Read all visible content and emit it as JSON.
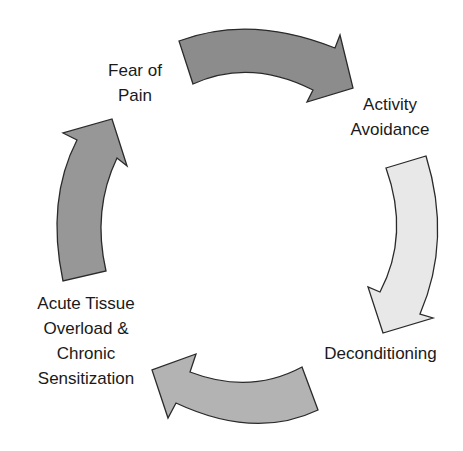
{
  "diagram": {
    "type": "cycle",
    "nodes": [
      {
        "id": "fear",
        "lines": [
          "Fear of",
          "Pain"
        ]
      },
      {
        "id": "activity",
        "lines": [
          "Activity",
          "Avoidance"
        ]
      },
      {
        "id": "decond",
        "lines": [
          "Deconditioning"
        ]
      },
      {
        "id": "acute",
        "lines": [
          "Acute Tissue",
          "Overload &",
          "Chronic",
          "Sensitization"
        ]
      }
    ],
    "arrows": [
      {
        "from": "fear",
        "to": "activity",
        "fill": "#8c8c8c"
      },
      {
        "from": "activity",
        "to": "decond",
        "fill": "#e8e8e8"
      },
      {
        "from": "decond",
        "to": "acute",
        "fill": "#b3b3b3"
      },
      {
        "from": "acute",
        "to": "fear",
        "fill": "#979797"
      }
    ],
    "stroke": "#2a2a2a"
  }
}
